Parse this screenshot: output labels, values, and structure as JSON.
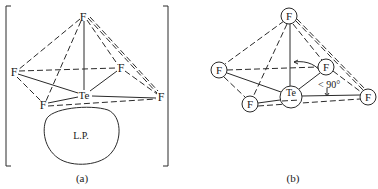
{
  "panel_a": {
    "caption": "(a)",
    "central_atom": "Te",
    "ligand": "F",
    "lone_pair_label": "L.P.",
    "atoms": [
      {
        "id": "top",
        "label": "F"
      },
      {
        "id": "left",
        "label": "F"
      },
      {
        "id": "right_mid",
        "label": "F"
      },
      {
        "id": "far_right",
        "label": "F"
      },
      {
        "id": "bottom_left",
        "label": "F"
      },
      {
        "id": "center",
        "label": "Te"
      }
    ]
  },
  "panel_b": {
    "caption": "(b)",
    "central_atom": "Te",
    "ligand": "F",
    "angle_label": "< 90°",
    "atoms": [
      {
        "id": "top",
        "label": "F"
      },
      {
        "id": "left",
        "label": "F"
      },
      {
        "id": "right_mid",
        "label": "F"
      },
      {
        "id": "far_right",
        "label": "F"
      },
      {
        "id": "bottom_left",
        "label": "F"
      },
      {
        "id": "center",
        "label": "Te"
      }
    ]
  }
}
